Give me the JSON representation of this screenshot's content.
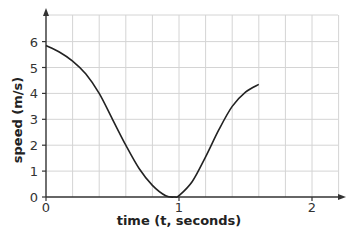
{
  "chart_data": {
    "type": "line",
    "title": "",
    "xlabel": "time (t, seconds)",
    "ylabel": "speed (m/s)",
    "xlim": [
      0,
      2.2
    ],
    "ylim": [
      0,
      6.8
    ],
    "x_ticks": [
      "0",
      "1",
      "2"
    ],
    "y_ticks": [
      "0",
      "1",
      "2",
      "3",
      "4",
      "5",
      "6"
    ],
    "grid": true,
    "grid_x_step": 0.2,
    "grid_y_step": 1,
    "legend": null,
    "series": [
      {
        "name": "speed",
        "x": [
          0,
          0.1,
          0.2,
          0.3,
          0.4,
          0.5,
          0.6,
          0.7,
          0.8,
          0.9,
          0.97,
          1.0,
          1.1,
          1.2,
          1.3,
          1.4,
          1.5,
          1.6
        ],
        "values": [
          5.85,
          5.6,
          5.25,
          4.75,
          4.0,
          3.0,
          2.0,
          1.1,
          0.45,
          0.05,
          0.0,
          0.05,
          0.6,
          1.55,
          2.6,
          3.5,
          4.05,
          4.35
        ]
      }
    ]
  },
  "axes": {
    "x_label": "time (t, seconds)",
    "y_label": "speed (m/s)",
    "x_tick_labels": [
      "0",
      "1",
      "2"
    ],
    "y_tick_labels": [
      "0",
      "1",
      "2",
      "3",
      "4",
      "5",
      "6"
    ]
  }
}
